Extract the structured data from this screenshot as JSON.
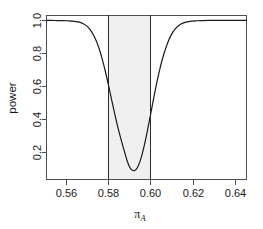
{
  "chart_data": {
    "type": "line",
    "title": "",
    "xlabel": "π_A",
    "xlabel_base": "π",
    "xlabel_sub": "A",
    "ylabel": "power",
    "xlim": [
      0.5505,
      0.6457
    ],
    "ylim": [
      0.03,
      1.03
    ],
    "xticks": [
      0.56,
      0.58,
      0.6,
      0.62,
      0.64
    ],
    "xtick_labels": [
      "0.56",
      "0.58",
      "0.60",
      "0.62",
      "0.64"
    ],
    "yticks": [
      0.2,
      0.4,
      0.6,
      0.8,
      1.0
    ],
    "ytick_labels": [
      "0.2",
      "0.4",
      "0.6",
      "0.8",
      "1.0"
    ],
    "grid": false,
    "legend": "none",
    "curve_color": "#1a1a1a",
    "band_color": "#f0f0f0",
    "vline_color": "#2b2b2b",
    "axis_color": "#4d4d4d",
    "annotations": {
      "shaded_region_start": 0.58,
      "shaded_region_end": 0.6,
      "vertical_line_1": 0.58,
      "vertical_line_2": 0.6,
      "minimum_x": 0.59,
      "minimum_y": 0.08
    },
    "series": [
      {
        "name": "power",
        "x": [
          0.5505,
          0.553,
          0.5555,
          0.558,
          0.5605,
          0.563,
          0.5655,
          0.568,
          0.57,
          0.572,
          0.574,
          0.5755,
          0.577,
          0.5785,
          0.58,
          0.5815,
          0.583,
          0.5845,
          0.586,
          0.5875,
          0.589,
          0.59,
          0.591,
          0.5925,
          0.594,
          0.5955,
          0.597,
          0.5985,
          0.6,
          0.6015,
          0.603,
          0.6045,
          0.606,
          0.608,
          0.61,
          0.612,
          0.6145,
          0.617,
          0.6195,
          0.622,
          0.625,
          0.629,
          0.633,
          0.638,
          0.643,
          0.6457
        ],
        "y": [
          1.0,
          1.0,
          0.999,
          0.999,
          0.998,
          0.996,
          0.991,
          0.98,
          0.962,
          0.93,
          0.88,
          0.83,
          0.766,
          0.69,
          0.605,
          0.516,
          0.428,
          0.346,
          0.273,
          0.205,
          0.14,
          0.108,
          0.09,
          0.085,
          0.108,
          0.16,
          0.235,
          0.325,
          0.424,
          0.524,
          0.62,
          0.706,
          0.78,
          0.858,
          0.915,
          0.952,
          0.978,
          0.99,
          0.996,
          0.998,
          0.999,
          1.0,
          1.0,
          1.0,
          1.0,
          1.0
        ]
      }
    ]
  }
}
